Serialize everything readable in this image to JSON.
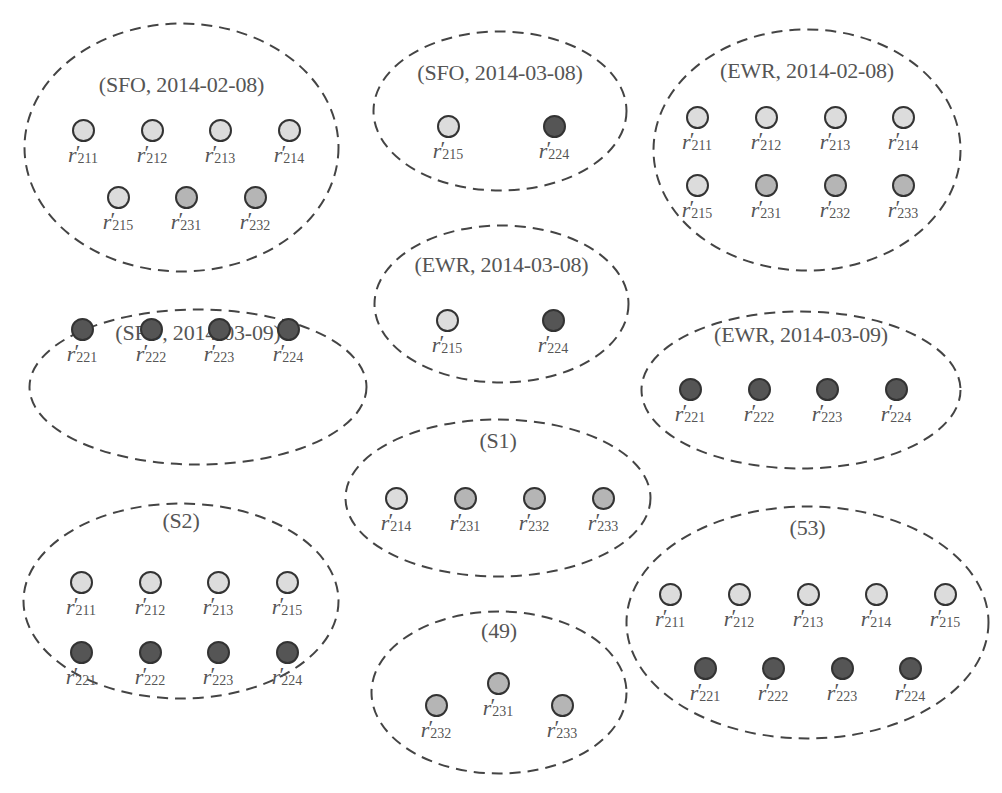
{
  "colors": {
    "light": "#dcdcdc",
    "medium": "#b5b5b5",
    "dark": "#555555",
    "stroke": "#333333",
    "dash": "#444444"
  },
  "label_symbol": "r",
  "label_prime": "′",
  "clusters": [
    {
      "id": "sfo-2014-02-08",
      "title": "(SFO, 2014-02-08)",
      "box": [
        23,
        22,
        317,
        251
      ],
      "title_y": 62,
      "nodes": [
        {
          "sub": "211",
          "shade": "light",
          "x": 60,
          "y": 108
        },
        {
          "sub": "212",
          "shade": "light",
          "x": 129,
          "y": 108
        },
        {
          "sub": "213",
          "shade": "light",
          "x": 197,
          "y": 108
        },
        {
          "sub": "214",
          "shade": "light",
          "x": 266,
          "y": 108
        },
        {
          "sub": "215",
          "shade": "light",
          "x": 95,
          "y": 175
        },
        {
          "sub": "231",
          "shade": "medium",
          "x": 163,
          "y": 175
        },
        {
          "sub": "232",
          "shade": "medium",
          "x": 232,
          "y": 175
        }
      ]
    },
    {
      "id": "sfo-2014-03-08",
      "title": "(SFO, 2014-03-08)",
      "box": [
        372,
        30,
        256,
        162
      ],
      "title_y": 42,
      "nodes": [
        {
          "sub": "215",
          "shade": "light",
          "x": 76,
          "y": 96
        },
        {
          "sub": "224",
          "shade": "dark",
          "x": 182,
          "y": 96
        }
      ]
    },
    {
      "id": "ewr-2014-02-08",
      "title": "(EWR, 2014-02-08)",
      "box": [
        652,
        28,
        310,
        244
      ],
      "title_y": 42,
      "nodes": [
        {
          "sub": "211",
          "shade": "light",
          "x": 45,
          "y": 89
        },
        {
          "sub": "212",
          "shade": "light",
          "x": 114,
          "y": 89
        },
        {
          "sub": "213",
          "shade": "light",
          "x": 183,
          "y": 89
        },
        {
          "sub": "214",
          "shade": "light",
          "x": 251,
          "y": 89
        },
        {
          "sub": "215",
          "shade": "light",
          "x": 45,
          "y": 157
        },
        {
          "sub": "231",
          "shade": "medium",
          "x": 114,
          "y": 157
        },
        {
          "sub": "232",
          "shade": "medium",
          "x": 183,
          "y": 157
        },
        {
          "sub": "233",
          "shade": "medium",
          "x": 251,
          "y": 157
        }
      ]
    },
    {
      "id": "ewr-2014-03-08",
      "title": "(EWR, 2014-03-08)",
      "box": [
        373,
        224,
        257,
        160
      ],
      "title_y": 40,
      "nodes": [
        {
          "sub": "215",
          "shade": "light",
          "x": 74,
          "y": 96
        },
        {
          "sub": "224",
          "shade": "dark",
          "x": 180,
          "y": 96
        }
      ]
    },
    {
      "id": "sfo-2014-03-09",
      "title": "(SFO, 2014-03-09)",
      "box": [
        28,
        308,
        340,
        158
      ],
      "title_y": 24,
      "nodes": [
        {
          "sub": "221",
          "shade": "dark",
          "x": 54,
          "y": 21
        },
        {
          "sub": "222",
          "shade": "dark",
          "x": 123,
          "y": 21
        },
        {
          "sub": "223",
          "shade": "dark",
          "x": 191,
          "y": 21
        },
        {
          "sub": "224",
          "shade": "dark",
          "x": 260,
          "y": 21
        }
      ]
    },
    {
      "id": "ewr-2014-03-09",
      "title": "(EWR, 2014-03-09)",
      "box": [
        640,
        310,
        322,
        160
      ],
      "title_y": 24,
      "nodes": [
        {
          "sub": "221",
          "shade": "dark",
          "x": 50,
          "y": 79
        },
        {
          "sub": "222",
          "shade": "dark",
          "x": 119,
          "y": 79
        },
        {
          "sub": "223",
          "shade": "dark",
          "x": 187,
          "y": 79
        },
        {
          "sub": "224",
          "shade": "dark",
          "x": 256,
          "y": 79
        }
      ]
    },
    {
      "id": "s1",
      "title": "(S1)",
      "box": [
        344,
        418,
        308,
        160
      ],
      "title_y": 22,
      "nodes": [
        {
          "sub": "214",
          "shade": "light",
          "x": 52,
          "y": 80
        },
        {
          "sub": "231",
          "shade": "medium",
          "x": 121,
          "y": 80
        },
        {
          "sub": "232",
          "shade": "medium",
          "x": 190,
          "y": 80
        },
        {
          "sub": "233",
          "shade": "medium",
          "x": 259,
          "y": 80
        }
      ]
    },
    {
      "id": "s2",
      "title": "(S2)",
      "box": [
        22,
        502,
        318,
        198
      ],
      "title_y": 18,
      "nodes": [
        {
          "sub": "211",
          "shade": "light",
          "x": 59,
          "y": 80
        },
        {
          "sub": "212",
          "shade": "light",
          "x": 128,
          "y": 80
        },
        {
          "sub": "213",
          "shade": "light",
          "x": 196,
          "y": 80
        },
        {
          "sub": "215",
          "shade": "light",
          "x": 265,
          "y": 80
        },
        {
          "sub": "221",
          "shade": "dark",
          "x": 59,
          "y": 150
        },
        {
          "sub": "222",
          "shade": "dark",
          "x": 128,
          "y": 150
        },
        {
          "sub": "223",
          "shade": "dark",
          "x": 196,
          "y": 150
        },
        {
          "sub": "224",
          "shade": "dark",
          "x": 265,
          "y": 150
        }
      ]
    },
    {
      "id": "cluster-49",
      "title": "(49)",
      "box": [
        370,
        610,
        258,
        165
      ],
      "title_y": 20,
      "nodes": [
        {
          "sub": "232",
          "shade": "medium",
          "x": 66,
          "y": 95
        },
        {
          "sub": "231",
          "shade": "medium",
          "x": 128,
          "y": 73
        },
        {
          "sub": "233",
          "shade": "medium",
          "x": 192,
          "y": 95
        }
      ]
    },
    {
      "id": "cluster-53",
      "title": "(53)",
      "box": [
        625,
        505,
        365,
        235
      ],
      "title_y": 22,
      "nodes": [
        {
          "sub": "211",
          "shade": "light",
          "x": 45,
          "y": 89
        },
        {
          "sub": "212",
          "shade": "light",
          "x": 114,
          "y": 89
        },
        {
          "sub": "213",
          "shade": "light",
          "x": 183,
          "y": 89
        },
        {
          "sub": "214",
          "shade": "light",
          "x": 251,
          "y": 89
        },
        {
          "sub": "215",
          "shade": "light",
          "x": 320,
          "y": 89
        },
        {
          "sub": "221",
          "shade": "dark",
          "x": 80,
          "y": 163
        },
        {
          "sub": "222",
          "shade": "dark",
          "x": 148,
          "y": 163
        },
        {
          "sub": "223",
          "shade": "dark",
          "x": 217,
          "y": 163
        },
        {
          "sub": "224",
          "shade": "dark",
          "x": 285,
          "y": 163
        }
      ]
    }
  ]
}
